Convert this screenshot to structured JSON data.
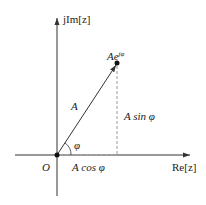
{
  "diagram": {
    "type": "complex-plane phasor",
    "axes": {
      "imag_label": "jIm[z]",
      "real_label": "Re[z]"
    },
    "origin_label": "O",
    "point_label": "Ae",
    "point_exponent": "jφ",
    "vector_label": "A",
    "angle_label": "φ",
    "vertical_projection_label": "A sin φ",
    "horizontal_projection_label": "A cos φ",
    "colors": {
      "line": "#333333",
      "dashed": "#999999",
      "text": "#222222"
    }
  }
}
